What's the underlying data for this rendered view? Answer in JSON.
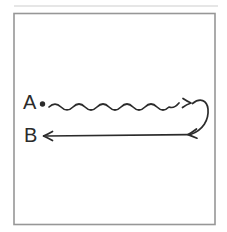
{
  "figure": {
    "labels": {
      "a": "A",
      "b": "B"
    },
    "colors": {
      "ink": "#2b2b2b",
      "frame": "#979797",
      "artifact": "#d8d8d8",
      "background": "#ffffff"
    }
  }
}
